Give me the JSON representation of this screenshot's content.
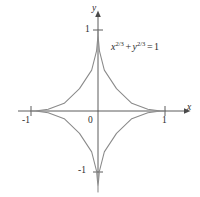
{
  "figure": {
    "background_color": "#ffffff",
    "curve_color": "#8a8a8a",
    "axis_color": "#4a4a4a",
    "text_color": "#2b2b2b"
  },
  "axes": {
    "x_label": "x",
    "y_label": "y",
    "origin_label": "0",
    "x_ticks": [
      "-1",
      "1"
    ],
    "y_ticks": [
      "1",
      "-1"
    ]
  },
  "annotation": {
    "equation_text": "x^{2/3} + y^{2/3} = 1",
    "base_x": "x",
    "exp_x": "2/3",
    "plus": "+",
    "base_y": "y",
    "exp_y": "2/3",
    "equals": "=",
    "rhs": "1"
  },
  "chart_data": {
    "type": "line",
    "title": "",
    "subtitle": "",
    "xlabel": "x",
    "ylabel": "y",
    "xlim": [
      -1.35,
      1.35
    ],
    "ylim": [
      -1.35,
      1.35
    ],
    "xticks": [
      -1,
      1
    ],
    "yticks": [
      -1,
      1
    ],
    "xticklabels": [
      "-1",
      "1"
    ],
    "yticklabels": [
      "1",
      "-1"
    ],
    "grid": false,
    "legend": false,
    "legend_position": "none",
    "annotations": [
      {
        "text": "x^{2/3} + y^{2/3} = 1",
        "x": 0.35,
        "y": 0.82
      }
    ],
    "series": [
      {
        "name": "astroid: x^{2/3} + y^{2/3} = 1",
        "closed": true,
        "parametric": {
          "x": "cos(t)^3",
          "y": "sin(t)^3",
          "t_range": [
            0,
            6.283185307179586
          ]
        },
        "points": [
          [
            1.0,
            0.0
          ],
          [
            0.9351,
            0.0003
          ],
          [
            0.7437,
            0.0214
          ],
          [
            0.5044,
            0.0945
          ],
          [
            0.2759,
            0.2759
          ],
          [
            0.0945,
            0.5044
          ],
          [
            0.0214,
            0.7437
          ],
          [
            0.0003,
            0.9351
          ],
          [
            0.0,
            1.0
          ],
          [
            -0.0003,
            0.9351
          ],
          [
            -0.0214,
            0.7437
          ],
          [
            -0.0945,
            0.5044
          ],
          [
            -0.2759,
            0.2759
          ],
          [
            -0.5044,
            0.0945
          ],
          [
            -0.7437,
            0.0214
          ],
          [
            -0.9351,
            0.0003
          ],
          [
            -1.0,
            0.0
          ],
          [
            -0.9351,
            -0.0003
          ],
          [
            -0.7437,
            -0.0214
          ],
          [
            -0.5044,
            -0.0945
          ],
          [
            -0.2759,
            -0.2759
          ],
          [
            -0.0945,
            -0.5044
          ],
          [
            -0.0214,
            -0.7437
          ],
          [
            -0.0003,
            -0.9351
          ],
          [
            0.0,
            -1.0
          ],
          [
            0.0003,
            -0.9351
          ],
          [
            0.0214,
            -0.7437
          ],
          [
            0.0945,
            -0.5044
          ],
          [
            0.2759,
            -0.2759
          ],
          [
            0.5044,
            -0.0945
          ],
          [
            0.7437,
            -0.0214
          ],
          [
            0.9351,
            -0.0003
          ],
          [
            1.0,
            0.0
          ]
        ]
      }
    ]
  }
}
